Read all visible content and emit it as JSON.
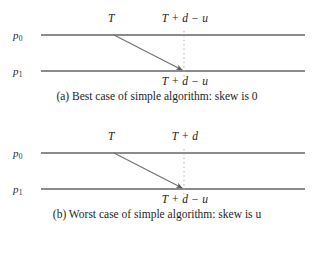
{
  "figure": {
    "panels": [
      {
        "id": "a",
        "p0_label": "p",
        "p0_sub": "0",
        "p1_label": "p",
        "p1_sub": "1",
        "send_label": "T",
        "top_right_label": "T + d − u",
        "bottom_label": "T + d − u",
        "caption_prefix": "(a) Best case of simple algorithm: skew is ",
        "caption_value": "0",
        "caption_full": "(a) Best case of simple algorithm: skew is 0"
      },
      {
        "id": "b",
        "p0_label": "p",
        "p0_sub": "0",
        "p1_label": "p",
        "p1_sub": "1",
        "send_label": "T",
        "top_right_label": "T + d",
        "bottom_label": "T + d − u",
        "caption_prefix": "(b) Worst case of simple algorithm: skew is ",
        "caption_value": "u",
        "caption_full": "(b) Worst case of simple algorithm: skew is u"
      }
    ],
    "colors": {
      "ink": "#1c1c1c",
      "timeline": "#8b8b8b",
      "arrow": "#6f6f6f",
      "dotted": "#a9a9a9",
      "background": "#ffffff"
    },
    "geometry": {
      "timeline_left": 41,
      "timeline_right": 305,
      "p0_y": 35,
      "p1_y": 71,
      "send_x": 114,
      "receive_x": 184
    }
  }
}
